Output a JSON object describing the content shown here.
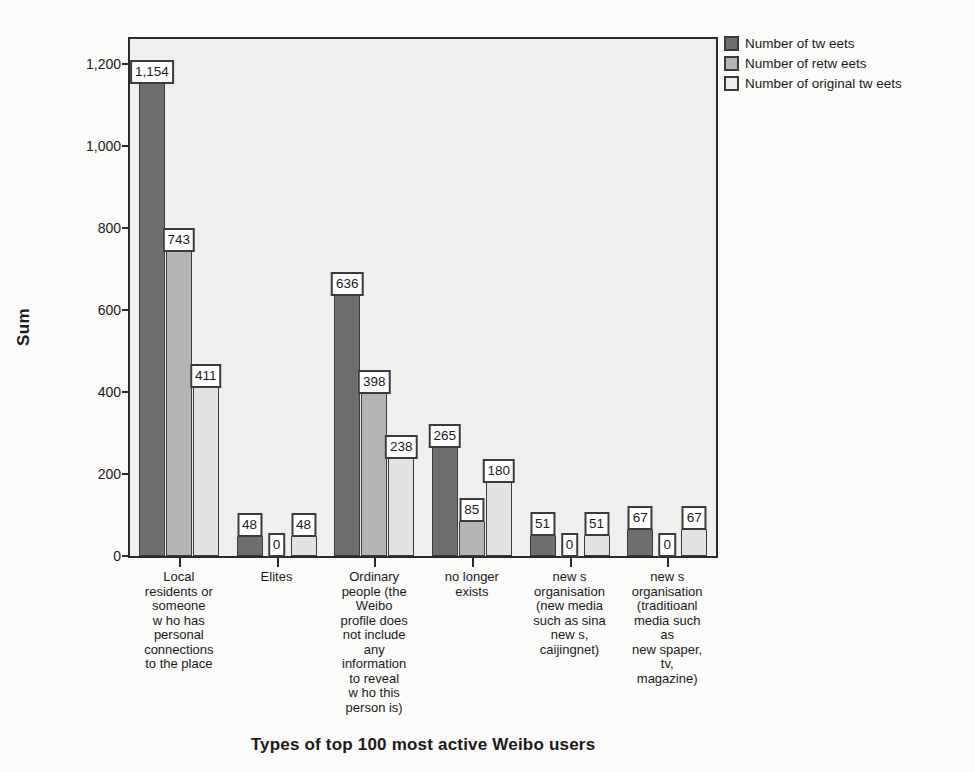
{
  "chart_data": {
    "type": "bar",
    "title": "",
    "xlabel": "Types of top 100 most active Weibo users",
    "ylabel": "Sum",
    "ylim": [
      0,
      1260
    ],
    "yticks": [
      "0",
      "200",
      "400",
      "600",
      "800",
      "1,000",
      "1,200"
    ],
    "ytick_values": [
      0,
      200,
      400,
      600,
      800,
      1000,
      1200
    ],
    "grid": false,
    "legend_position": "right-top",
    "categories": [
      "Local\nresidents or\nsomeone\nw ho has\npersonal\nconnections\nto the place",
      "Elites",
      "Ordinary\npeople (the\nWeibo\nprofile does\nnot include\nany\ninformation\nto reveal\nw ho this\nperson is)",
      "no longer\nexists",
      "new s\norganisation\n(new media\nsuch as sina\nnew s,\ncaijingnet)",
      "new s\norganisation\n(traditioanl\nmedia such\nas\nnew spaper,\ntv,\nmagazine)"
    ],
    "series": [
      {
        "name": "Number of tw eets",
        "color": "#6e6e6e",
        "values": [
          1154,
          48,
          636,
          265,
          51,
          67
        ]
      },
      {
        "name": "Number of retw eets",
        "color": "#b4b4b4",
        "values": [
          743,
          0,
          398,
          85,
          0,
          0
        ]
      },
      {
        "name": "Number of original tw eets",
        "color": "#e2e2e0",
        "values": [
          411,
          48,
          238,
          180,
          51,
          67
        ]
      }
    ],
    "data_labels": [
      [
        "1,154",
        "743",
        "411"
      ],
      [
        "48",
        "0",
        "48"
      ],
      [
        "636",
        "398",
        "238"
      ],
      [
        "265",
        "85",
        "180"
      ],
      [
        "51",
        "0",
        "51"
      ],
      [
        "67",
        "0",
        "67"
      ]
    ]
  },
  "legend": {
    "items": [
      {
        "label": "Number of tw eets"
      },
      {
        "label": "Number of retw eets"
      },
      {
        "label": "Number of original tw eets"
      }
    ]
  },
  "background_text": [
    "eels w ho w ere unaware 1 profiles, the rest",
    "ts (1-24%). It is difficult to trace w hy these reposts w ere",
    "ed once their tw eets disappeared in the re-transmitting process.",
    "then Caijingnet, the reporter and a number of local residents w ho",
    "quakes but cannot make sure how many remain during and after",
    "d be interested about the 'breaking' people: tw o those w ho post",
    "are very short. Weibo w as both fed by real people w ho w itnessed",
    "e but also very often from other users. How ever, the initial",
    "oint, then the number of users w ho start posting tw eets and",
    "ed by the influence of traditional media, particularly the",
    "rs in all of the case-derived clusters.",
    "of and differentiations"
  ]
}
